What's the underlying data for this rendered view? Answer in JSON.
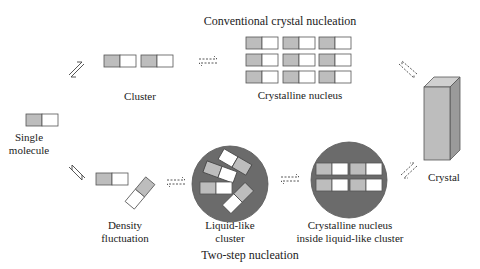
{
  "diagram": {
    "top_title": "Conventional crystal nucleation",
    "bottom_title": "Two-step nucleation",
    "nodes": {
      "single_molecule": {
        "line1": "Single",
        "line2": "molecule"
      },
      "cluster": {
        "label": "Cluster"
      },
      "crystalline_nucleus": {
        "label": "Crystalline nucleus"
      },
      "crystal": {
        "label": "Crystal"
      },
      "density_fluctuation": {
        "line1": "Density",
        "line2": "fluctuation"
      },
      "liquid_like_cluster": {
        "line1": "Liquid-like",
        "line2": "cluster"
      },
      "crystalline_nucleus_inside": {
        "line1": "Crystalline nucleus",
        "line2": "inside liquid-like cluster"
      }
    },
    "colors": {
      "molecule_shaded": "#bdbdbd",
      "molecule_plain": "#ffffff",
      "molecule_border": "#555555",
      "cluster_circle": "#6b6b6b",
      "crystal_front": "#bdbdbd",
      "crystal_top": "#d0d0d0",
      "crystal_side": "#9a9a9a"
    },
    "arrows": [
      {
        "from": "single_molecule",
        "to": "cluster",
        "style": "equilibrium-solid"
      },
      {
        "from": "cluster",
        "to": "crystalline_nucleus",
        "style": "equilibrium-dashed"
      },
      {
        "from": "crystalline_nucleus",
        "to": "crystal",
        "style": "equilibrium-dashed"
      },
      {
        "from": "single_molecule",
        "to": "density_fluctuation",
        "style": "equilibrium-solid"
      },
      {
        "from": "density_fluctuation",
        "to": "liquid_like_cluster",
        "style": "equilibrium-dashed"
      },
      {
        "from": "liquid_like_cluster",
        "to": "crystalline_nucleus_inside",
        "style": "equilibrium-dashed"
      },
      {
        "from": "crystalline_nucleus_inside",
        "to": "crystal",
        "style": "equilibrium-dashed"
      }
    ]
  }
}
